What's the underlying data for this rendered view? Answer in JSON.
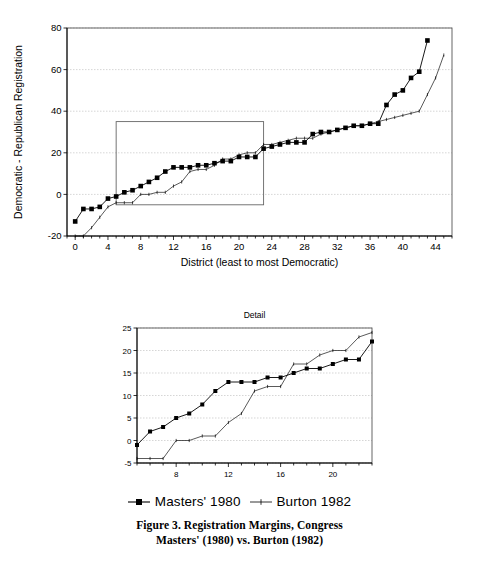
{
  "figure": {
    "caption_line1": "Figure 3. Registration Margins, Congress",
    "caption_line2": "Masters' (1980) vs. Burton (1982)"
  },
  "legend": {
    "items": [
      {
        "label": "Masters' 1980",
        "marker": "filled-square",
        "color": "#000000"
      },
      {
        "label": "Burton 1982",
        "marker": "thin-line",
        "color": "#000000"
      }
    ]
  },
  "chart_data": [
    {
      "id": "main",
      "type": "line",
      "title": "",
      "xlabel": "District (least to most Democratic)",
      "ylabel": "Democratic - Republican Registration",
      "xlim": [
        -1,
        46
      ],
      "ylim": [
        -20,
        80
      ],
      "xticks": [
        0,
        4,
        8,
        12,
        16,
        20,
        24,
        28,
        32,
        36,
        40,
        44
      ],
      "yticks": [
        -20,
        0,
        20,
        40,
        60,
        80
      ],
      "grid": true,
      "legend_position": "below",
      "inset_highlight": {
        "x0": 5,
        "x1": 23,
        "y0": -5,
        "y1": 35
      },
      "series": [
        {
          "name": "Masters' 1980",
          "marker": "filled-square",
          "x": [
            0,
            1,
            2,
            3,
            4,
            5,
            6,
            7,
            8,
            9,
            10,
            11,
            12,
            13,
            14,
            15,
            16,
            17,
            18,
            19,
            20,
            21,
            22,
            23,
            24,
            25,
            26,
            27,
            28,
            29,
            30,
            31,
            32,
            33,
            34,
            35,
            36,
            37,
            38,
            39,
            40,
            41,
            42,
            43
          ],
          "y": [
            -13,
            -7,
            -7,
            -6,
            -2,
            -1,
            1,
            2,
            4,
            6,
            8,
            11,
            13,
            13,
            13,
            14,
            14,
            15,
            16,
            16,
            18,
            18,
            18,
            22,
            23,
            24,
            25,
            25,
            25,
            29,
            30,
            30,
            31,
            32,
            33,
            33,
            34,
            34,
            43,
            48,
            50,
            56,
            59,
            74
          ]
        },
        {
          "name": "Burton 1982",
          "marker": "tick",
          "x": [
            0,
            1,
            2,
            3,
            4,
            5,
            6,
            7,
            8,
            9,
            10,
            11,
            12,
            13,
            14,
            15,
            16,
            17,
            18,
            19,
            20,
            21,
            22,
            23,
            24,
            25,
            26,
            27,
            28,
            29,
            30,
            31,
            32,
            33,
            34,
            35,
            36,
            37,
            38,
            39,
            40,
            41,
            42,
            43,
            44,
            45
          ],
          "y": [
            -20,
            -20,
            -16,
            -11,
            -6,
            -4,
            -4,
            -4,
            0,
            0,
            1,
            1,
            4,
            6,
            11,
            12,
            12,
            14,
            17,
            17,
            19,
            20,
            20,
            24,
            24,
            25,
            26,
            27,
            27,
            27,
            29,
            30,
            31,
            32,
            33,
            33,
            34,
            35,
            36,
            37,
            38,
            39,
            40,
            48,
            56,
            67
          ]
        }
      ]
    },
    {
      "id": "detail",
      "type": "line",
      "title": "Detail",
      "xlabel": "",
      "ylabel": "",
      "xlim": [
        5,
        23
      ],
      "ylim": [
        -5,
        25
      ],
      "xticks": [
        8,
        12,
        16,
        20
      ],
      "yticks": [
        -5,
        0,
        5,
        10,
        15,
        20,
        25
      ],
      "grid": true,
      "series": [
        {
          "name": "Masters' 1980",
          "marker": "filled-square",
          "x": [
            5,
            6,
            7,
            8,
            9,
            10,
            11,
            12,
            13,
            14,
            15,
            16,
            17,
            18,
            19,
            20,
            21,
            22,
            23
          ],
          "y": [
            -1,
            2,
            3,
            5,
            6,
            8,
            11,
            13,
            13,
            13,
            14,
            14,
            15,
            16,
            16,
            17,
            18,
            18,
            22
          ]
        },
        {
          "name": "Burton 1982",
          "marker": "tick",
          "x": [
            5,
            6,
            7,
            8,
            9,
            10,
            11,
            12,
            13,
            14,
            15,
            16,
            17,
            18,
            19,
            20,
            21,
            22,
            23
          ],
          "y": [
            -4,
            -4,
            -4,
            0,
            0,
            1,
            1,
            4,
            6,
            11,
            12,
            12,
            17,
            17,
            19,
            20,
            20,
            23,
            24
          ]
        }
      ]
    }
  ]
}
